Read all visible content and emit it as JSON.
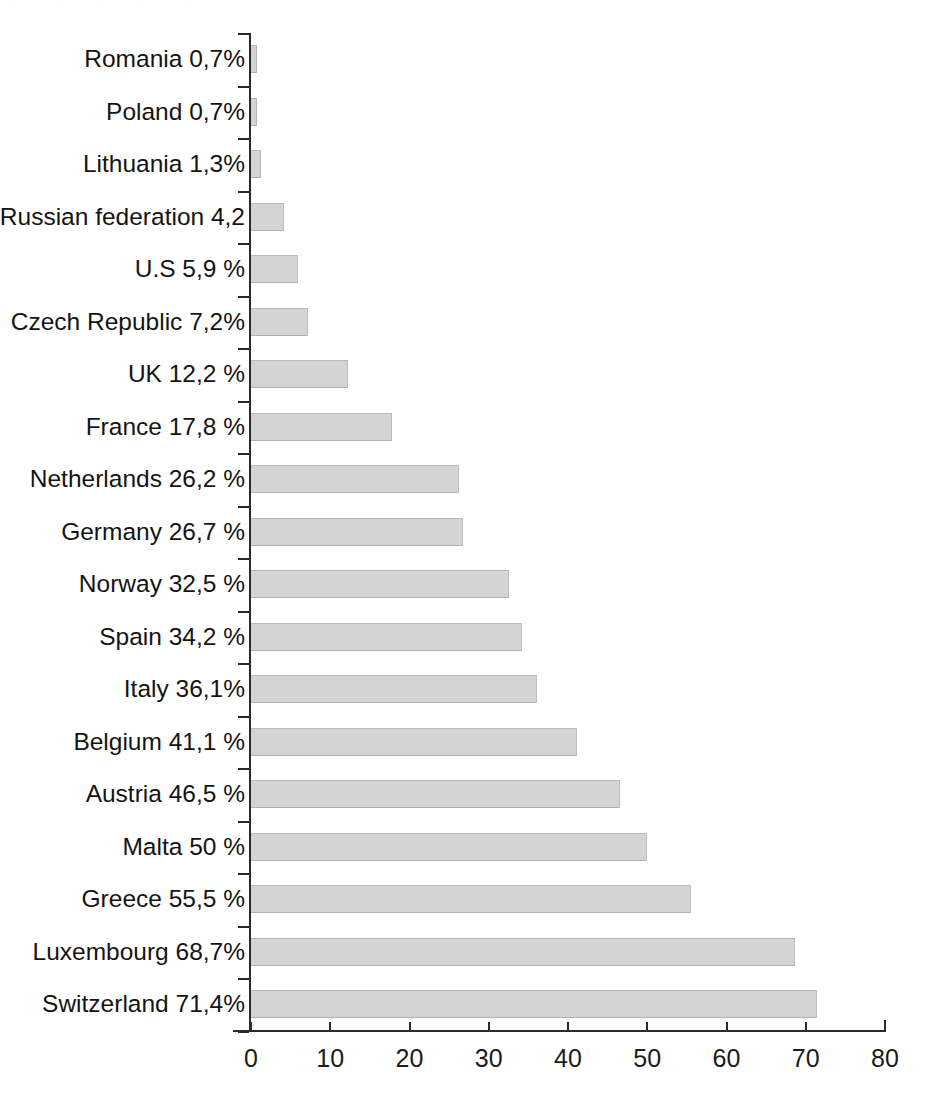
{
  "chart_data": {
    "type": "bar",
    "orientation": "horizontal",
    "title": "",
    "xlabel": "",
    "ylabel": "",
    "xlim": [
      0,
      80
    ],
    "xticks": [
      0,
      10,
      20,
      30,
      40,
      50,
      60,
      70,
      80
    ],
    "xtick_labels": [
      "0",
      "10",
      "20",
      "30",
      "40",
      "50",
      "60",
      "70",
      "80"
    ],
    "grid": false,
    "legend": null,
    "bar_color": "#d4d4d4",
    "axis_color": "#2b2b2b",
    "categories": [
      "Romania 0,7%",
      "Poland 0,7%",
      "Lithuania 1,3%",
      "Russian federation 4,2",
      "U.S 5,9 %",
      "Czech Republic 7,2%",
      "UK 12,2 %",
      "France 17,8 %",
      "Netherlands 26,2 %",
      "Germany 26,7 %",
      "Norway 32,5 %",
      "Spain 34,2 %",
      "Italy 36,1%",
      "Belgium 41,1 %",
      "Austria 46,5 %",
      "Malta 50 %",
      "Greece 55,5 %",
      "Luxembourg 68,7%",
      "Switzerland 71,4%"
    ],
    "values": [
      0.7,
      0.7,
      1.3,
      4.2,
      5.9,
      7.2,
      12.2,
      17.8,
      26.2,
      26.7,
      32.5,
      34.2,
      36.1,
      41.1,
      46.5,
      50,
      55.5,
      68.7,
      71.4
    ],
    "value_unit": "%"
  },
  "page": {
    "clipped_header_text": "⌐ ¬ ⌐ ¬ ⌐ ¬ ⌐ ¬ ⌐ ¬"
  }
}
